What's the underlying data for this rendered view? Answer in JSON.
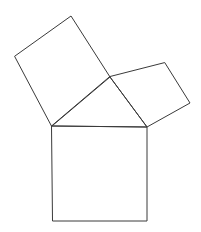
{
  "figure": {
    "name": "pythagorean-theorem-diagram",
    "title": "Pythagorean theorem figure: three squares on the sides of a right triangle",
    "background_color": "#ffffff",
    "stroke_color": "#3a3a3a",
    "stroke_width": 1,
    "canvas": {
      "width": 201,
      "height": 232
    },
    "labels": [],
    "triangle": {
      "name": "right-triangle",
      "vertices": [
        {
          "id": "A",
          "x": 52,
          "y": 126
        },
        {
          "id": "B",
          "x": 147,
          "y": 127
        },
        {
          "id": "C",
          "x": 110,
          "y": 77
        }
      ],
      "right_angle_at": "C",
      "points": "52,126 147,127 110,77"
    },
    "squares": [
      {
        "name": "square-on-hypotenuse",
        "side_label": "hypotenuse",
        "orientation": "axis-aligned",
        "points": "52,126 147,127 147,221 53,221"
      },
      {
        "name": "square-on-long-leg",
        "side_label": "long-leg",
        "orientation": "tilted",
        "points": "52,126 110,77 71,16 15,56"
      },
      {
        "name": "square-on-short-leg",
        "side_label": "short-leg",
        "orientation": "tilted",
        "points": "110,77 147,127 190,103 165,63"
      }
    ]
  }
}
